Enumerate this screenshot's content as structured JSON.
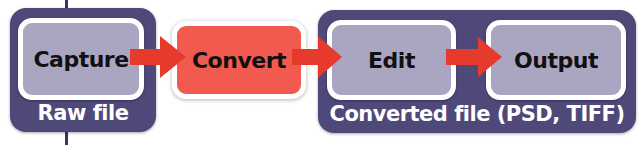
{
  "diagram": {
    "groups": [
      {
        "id": "raw",
        "label": "Raw file"
      },
      {
        "id": "converted",
        "label": "Converted file (PSD, TIFF)"
      }
    ],
    "steps": [
      {
        "id": "capture",
        "label": "Capture",
        "group": "raw"
      },
      {
        "id": "convert",
        "label": "Convert",
        "group": null
      },
      {
        "id": "edit",
        "label": "Edit",
        "group": "converted"
      },
      {
        "id": "output",
        "label": "Output",
        "group": "converted"
      }
    ],
    "edges": [
      {
        "from": "capture",
        "to": "convert"
      },
      {
        "from": "convert",
        "to": "edit"
      },
      {
        "from": "edit",
        "to": "output"
      }
    ],
    "colors": {
      "panel": "#4f497a",
      "step_box": "#aaa6c1",
      "highlight_box": "#f25a4f",
      "arrow": "#e63a2c",
      "box_border": "#ffffff"
    }
  }
}
